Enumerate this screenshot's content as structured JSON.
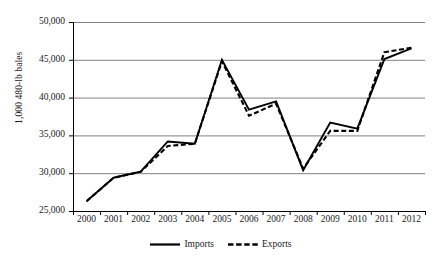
{
  "chart_data": {
    "type": "line",
    "title": "",
    "xlabel": "",
    "ylabel": "1,000 480-lb bales",
    "categories": [
      "2000",
      "2001",
      "2002",
      "2003",
      "2004",
      "2005",
      "2006",
      "2007",
      "2008",
      "2009",
      "2010",
      "2011",
      "2012"
    ],
    "x": [
      2000,
      2001,
      2002,
      2003,
      2004,
      2005,
      2006,
      2007,
      2008,
      2009,
      2010,
      2011,
      2012
    ],
    "series": [
      {
        "name": "Imports",
        "style": "solid",
        "color": "#000000",
        "values": [
          26300,
          29400,
          30200,
          34200,
          33900,
          45000,
          38400,
          39500,
          30400,
          36700,
          35900,
          45100,
          46500
        ]
      },
      {
        "name": "Exports",
        "style": "dashed",
        "color": "#000000",
        "values": [
          26300,
          29400,
          30200,
          33600,
          33900,
          44800,
          37600,
          39200,
          30600,
          35600,
          35600,
          46000,
          46600
        ]
      }
    ],
    "ylim": [
      25000,
      50000
    ],
    "yticks": [
      25000,
      30000,
      35000,
      40000,
      45000,
      50000
    ],
    "ytick_labels": [
      "25,000",
      "30,000",
      "35,000",
      "40,000",
      "45,000",
      "50,000"
    ],
    "grid": "horizontal",
    "legend_position": "bottom"
  },
  "legend": {
    "entries": [
      {
        "label": "Imports",
        "style": "solid"
      },
      {
        "label": "Exports",
        "style": "dashed"
      }
    ]
  },
  "colors": {
    "line": "#000000",
    "gridline": "#808080",
    "axis": "#000000",
    "background": "#ffffff"
  }
}
